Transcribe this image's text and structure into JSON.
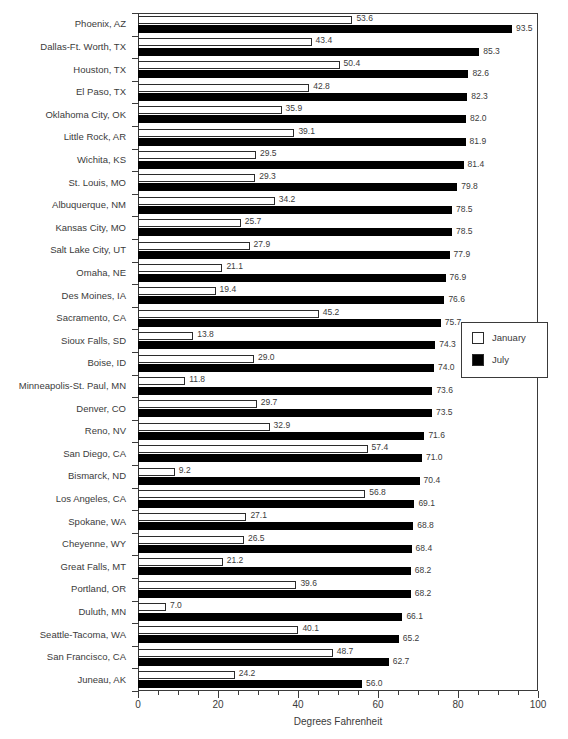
{
  "chart_data": {
    "type": "bar",
    "orientation": "horizontal",
    "title": "",
    "xlabel": "Degrees Fahrenheit",
    "ylabel": "",
    "xlim": [
      0,
      100
    ],
    "xticks": [
      0,
      20,
      40,
      60,
      80,
      100
    ],
    "xtick_labels": [
      "0",
      "20",
      "40",
      "60",
      "80",
      "100"
    ],
    "minor_tick_step": 5,
    "grid": false,
    "legend_position": "middle-right",
    "categories": [
      "Phoenix, AZ",
      "Dallas-Ft. Worth, TX",
      "Houston, TX",
      "El Paso, TX",
      "Oklahoma City, OK",
      "Little Rock, AR",
      "Wichita, KS",
      "St. Louis, MO",
      "Albuquerque, NM",
      "Kansas City, MO",
      "Salt Lake City, UT",
      "Omaha, NE",
      "Des Moines, IA",
      "Sacramento, CA",
      "Sioux Falls, SD",
      "Boise, ID",
      "Minneapolis-St. Paul, MN",
      "Denver, CO",
      "Reno, NV",
      "San Diego, CA",
      "Bismarck, ND",
      "Los Angeles, CA",
      "Spokane, WA",
      "Cheyenne, WY",
      "Great Falls, MT",
      "Portland, OR",
      "Duluth, MN",
      "Seattle-Tacoma, WA",
      "San Francisco, CA",
      "Juneau, AK"
    ],
    "series": [
      {
        "name": "January",
        "color": "#ffffff",
        "edge_color": "#2b2b2b",
        "values": [
          53.6,
          43.4,
          50.4,
          42.8,
          35.9,
          39.1,
          29.5,
          29.3,
          34.2,
          25.7,
          27.9,
          21.1,
          19.4,
          45.2,
          13.8,
          29.0,
          11.8,
          29.7,
          32.9,
          57.4,
          9.2,
          56.8,
          27.1,
          26.5,
          21.2,
          39.6,
          7.0,
          40.1,
          48.7,
          24.2
        ]
      },
      {
        "name": "July",
        "color": "#000000",
        "edge_color": "#000000",
        "values": [
          93.5,
          85.3,
          82.6,
          82.3,
          82.0,
          81.9,
          81.4,
          79.8,
          78.5,
          78.5,
          77.9,
          76.9,
          76.6,
          75.7,
          74.3,
          74.0,
          73.6,
          73.5,
          71.6,
          71.0,
          70.4,
          69.1,
          68.8,
          68.4,
          68.2,
          68.2,
          66.1,
          65.2,
          62.7,
          56.0
        ]
      }
    ],
    "value_labels": {
      "January": [
        "53.6",
        "43.4",
        "50.4",
        "42.8",
        "35.9",
        "39.1",
        "29.5",
        "29.3",
        "34.2",
        "25.7",
        "27.9",
        "21.1",
        "19.4",
        "45.2",
        "13.8",
        "29.0",
        "11.8",
        "29.7",
        "32.9",
        "57.4",
        "9.2",
        "56.8",
        "27.1",
        "26.5",
        "21.2",
        "39.6",
        "7.0",
        "40.1",
        "48.7",
        "24.2"
      ],
      "July": [
        "93.5",
        "85.3",
        "82.6",
        "82.3",
        "82.0",
        "81.9",
        "81.4",
        "79.8",
        "78.5",
        "78.5",
        "77.9",
        "76.9",
        "76.6",
        "75.7",
        "74.3",
        "74.0",
        "73.6",
        "73.5",
        "71.6",
        "71.0",
        "70.4",
        "69.1",
        "68.8",
        "68.4",
        "68.2",
        "68.2",
        "66.1",
        "65.2",
        "62.7",
        "56.0"
      ]
    }
  },
  "legend": {
    "items": [
      {
        "label": "January",
        "swatch": "white-square-icon"
      },
      {
        "label": "July",
        "swatch": "black-square-icon"
      }
    ]
  },
  "axis": {
    "x_title": "Degrees Fahrenheit",
    "x_tick_labels": [
      "0",
      "20",
      "40",
      "60",
      "80",
      "100"
    ]
  }
}
